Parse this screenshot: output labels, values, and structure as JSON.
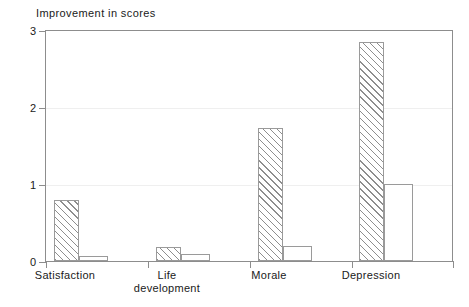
{
  "chart_data": {
    "type": "bar",
    "title": "Improvement in scores",
    "xlabel": "",
    "ylabel": "",
    "ylim": [
      0,
      3
    ],
    "yticks": [
      0,
      1,
      2,
      3
    ],
    "ytick_labels": [
      "0",
      "1",
      "2",
      "3"
    ],
    "grid": true,
    "legend": "none",
    "categories": [
      "Satisfaction",
      "Life development",
      "Morale",
      "Depression"
    ],
    "category_labels": [
      "Satisfaction",
      "Life\ndevelopment",
      "Morale",
      "Depression"
    ],
    "series": [
      {
        "name": "hatched",
        "fill": "diagonal-hatch",
        "values": [
          0.8,
          0.18,
          1.73,
          2.85
        ]
      },
      {
        "name": "open",
        "fill": "white",
        "values": [
          0.07,
          0.09,
          0.19,
          1.0
        ]
      }
    ],
    "colors": {
      "axis": "#8d8d8d",
      "grid": "#efefef",
      "bar_edge": "#9a9a9a",
      "hatch": "#8e8e8e",
      "text": "#1a1a1a",
      "background": "#ffffff"
    }
  }
}
